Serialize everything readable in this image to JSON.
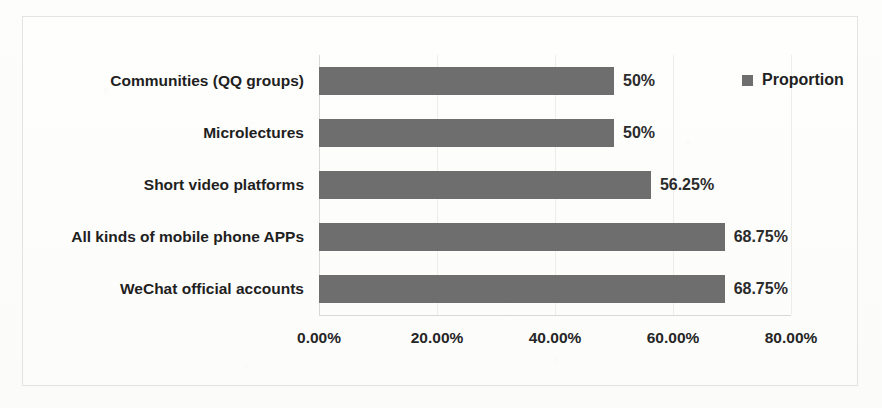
{
  "chart_data": {
    "type": "bar",
    "orientation": "horizontal",
    "title": "",
    "xlabel": "",
    "ylabel": "",
    "categories": [
      "Communities (QQ groups)",
      "Microlectures",
      "Short video platforms",
      "All kinds of mobile phone APPs",
      "WeChat official accounts"
    ],
    "values": [
      50,
      50,
      56.25,
      68.75,
      68.75
    ],
    "value_labels": [
      "50%",
      "50%",
      "56.25%",
      "68.75%",
      "68.75%"
    ],
    "series": [
      {
        "name": "Proportion",
        "values": [
          50,
          50,
          56.25,
          68.75,
          68.75
        ],
        "color": "#6e6e6e"
      }
    ],
    "xlim": [
      0,
      80
    ],
    "xticks": [
      0,
      20,
      40,
      60,
      80
    ],
    "xtick_labels": [
      "0.00%",
      "20.00%",
      "40.00%",
      "60.00%",
      "80.00%"
    ],
    "grid": true,
    "grid_axis": "x",
    "legend": {
      "position": "top-right",
      "entries": [
        {
          "label": "Proportion",
          "color": "#6e6e6e",
          "marker": "square"
        }
      ]
    }
  },
  "legend": {
    "proportion_label": "Proportion"
  },
  "colors": {
    "bar": "#6e6e6e",
    "text": "#1f1f1f",
    "frame": "#e3e3e1",
    "grid": "#ededea",
    "background": "#fdfdfb"
  }
}
